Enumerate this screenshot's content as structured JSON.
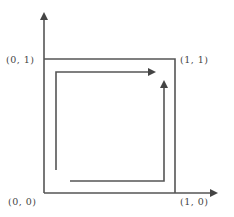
{
  "diagram": {
    "type": "unit square path on axes",
    "labels": {
      "top_left": "(0, 1)",
      "top_right": "(1, 1)",
      "bottom_left": "(0, 0)",
      "bottom_right": "(1, 0)"
    },
    "colors": {
      "stroke": "#555555",
      "background": "#ffffff"
    }
  }
}
